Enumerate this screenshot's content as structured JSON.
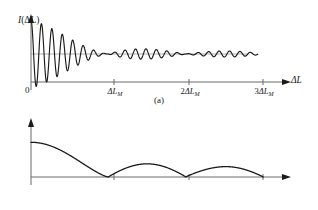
{
  "figure": {
    "background_color": "#ffffff",
    "stroke_color": "#1a1a1a",
    "axis_color": "#555555"
  },
  "panels": [
    {
      "id": "a",
      "caption": "(a)",
      "ylabel_main": "I",
      "ylabel_arg": "(ΔL)",
      "xlabel": "ΔL",
      "origin_label": "0"
    },
    {
      "id": "b",
      "caption": "(b)",
      "ylabel_main": "γ",
      "ylabel_arg": "(ΔL)",
      "xlabel": "ΔL",
      "origin_label": "0"
    }
  ],
  "ticks": {
    "t1_prefix": "",
    "t1_delta": "ΔL",
    "t1_sub": "M",
    "t2_prefix": "2",
    "t2_delta": "ΔL",
    "t2_sub": "M",
    "t3_prefix": "3",
    "t3_delta": "ΔL",
    "t3_sub": "M"
  },
  "chart_data": [
    {
      "type": "line",
      "panel": "a",
      "title": "",
      "xlabel": "ΔL",
      "ylabel": "I(ΔL)",
      "xlim": [
        0,
        3.18
      ],
      "ylim": [
        -1.15,
        1.15
      ],
      "xtick_values": [
        0,
        1,
        2,
        3
      ],
      "xtick_labels": [
        "0",
        "ΔL_M",
        "2ΔL_M",
        "3ΔL_M"
      ],
      "grid": false,
      "legend": null,
      "description": "Interference intensity versus path difference: rapid fringe oscillation about a constant mean level, modulated by a decaying sinc-like visibility envelope with nodes at ΔL_M, 2ΔL_M and 3ΔL_M, producing amplitude revivals between the nodes.",
      "baseline": 0,
      "fringe_period": 0.135,
      "envelope_nodes": [
        1,
        2,
        3
      ],
      "envelope_peaks": [
        {
          "x": 0.0,
          "amplitude": 1.0
        },
        {
          "x": 1.45,
          "amplitude": 0.3
        },
        {
          "x": 2.45,
          "amplitude": 0.2
        },
        {
          "x": 3.0,
          "amplitude": 0.0
        }
      ],
      "overall_decay": "exponential-like falloff of the envelope toward 3ΔL_M"
    },
    {
      "type": "line",
      "panel": "b",
      "title": "",
      "xlabel": "ΔL",
      "ylabel": "γ(ΔL)",
      "xlim": [
        0,
        3.18
      ],
      "ylim": [
        0,
        1.15
      ],
      "xtick_values": [
        0,
        1,
        2,
        3
      ],
      "xtick_labels": [
        "0",
        "ΔL_M",
        "2ΔL_M",
        "3ΔL_M"
      ],
      "grid": false,
      "legend": null,
      "description": "Fringe visibility (degree of coherence) versus path difference: rectified sinc-like envelope starting near 0.62, falling to zero at ΔL_M, with successively smaller rounded lobes peaking between the nodes and returning to zero at 2ΔL_M and 3ΔL_M.",
      "nodes": [
        1,
        2,
        3
      ],
      "lobes": [
        {
          "start": 0.0,
          "end": 1.0,
          "peak_x": 0.0,
          "peak_y": 0.62
        },
        {
          "start": 1.0,
          "end": 2.0,
          "peak_x": 1.5,
          "peak_y": 0.235
        },
        {
          "start": 2.0,
          "end": 3.0,
          "peak_x": 2.52,
          "peak_y": 0.185
        }
      ]
    }
  ]
}
